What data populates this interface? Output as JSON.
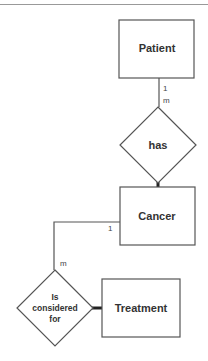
{
  "diagram": {
    "type": "er-diagram",
    "entities": [
      {
        "id": "patient",
        "label": "Patient"
      },
      {
        "id": "cancer",
        "label": "Cancer"
      },
      {
        "id": "treatment",
        "label": "Treatment"
      }
    ],
    "relationships": [
      {
        "id": "has",
        "label": "has",
        "from": "patient",
        "to": "cancer",
        "cardinality_from": "1",
        "cardinality_to": "m"
      },
      {
        "id": "considered",
        "label_lines": [
          "Is",
          "considered",
          "for"
        ],
        "from": "cancer",
        "to": "treatment",
        "cardinality_from": "1",
        "cardinality_to": "m"
      }
    ]
  },
  "colors": {
    "stroke": "#555555",
    "text": "#333333",
    "background": "#ffffff"
  }
}
